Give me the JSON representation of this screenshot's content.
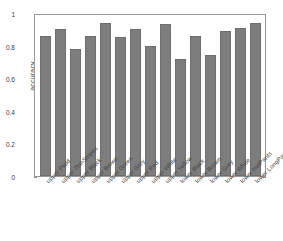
{
  "chart_data": {
    "type": "bar",
    "title": "",
    "xlabel": "",
    "ylabel": "accuracy",
    "ylim": [
      0,
      1
    ],
    "yticks": [
      "0",
      "0.2",
      "0.4",
      "0.6",
      "0.8",
      "1"
    ],
    "ytick_values": [
      0,
      0.2,
      0.4,
      0.6,
      0.8,
      1
    ],
    "grid": false,
    "legend": null,
    "bar_color": "#7d7d7d",
    "bar_edge_color": "#6e6e6e",
    "axes_color": "#9a9a9a",
    "background": "#ffffff",
    "categories": [
      "upper Plaid",
      "upper ThinStripes",
      "upper Black",
      "upper Brown",
      "upper Green",
      "upper Grey",
      "upper Red",
      "upper White",
      "upper Yellow",
      "lower Black",
      "lower Brown",
      "lower Grey",
      "lower White",
      "lower HotPants",
      "lower LongPant"
    ],
    "values": [
      0.86,
      0.9,
      0.78,
      0.86,
      0.94,
      0.85,
      0.9,
      0.8,
      0.93,
      0.72,
      0.86,
      0.74,
      0.89,
      0.91,
      0.94
    ]
  }
}
